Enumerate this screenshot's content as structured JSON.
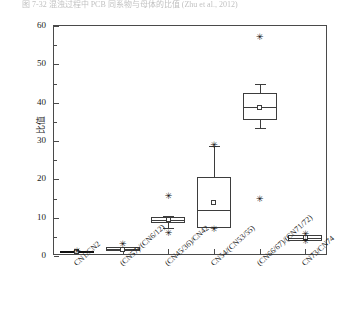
{
  "caption": "图 7-32   混浊过程中 PCB 同系物与母体的比值 (Zhu et al., 2012)",
  "chart_data": {
    "type": "box",
    "title": "",
    "xlabel": "",
    "ylabel": "比值",
    "ylim": [
      0,
      60
    ],
    "yticks": [
      0,
      10,
      20,
      30,
      40,
      50,
      60
    ],
    "ytick_labels": [
      "0",
      "10",
      "20",
      "30",
      "40",
      "50",
      "60"
    ],
    "minor_ticks": true,
    "grid": false,
    "legend": null,
    "categories": [
      "CN1/CN2",
      "(CN57)/(CN6/12)",
      "(CN45/36)/CN42",
      "CN54/(CN53/55)",
      "(CN66/67)/(CN71/72)",
      "CN73/CN74"
    ],
    "boxes": [
      {
        "label": "CN1/CN2",
        "q1": 1.0,
        "median": 1.1,
        "q3": 1.2,
        "whisker_low": 1.0,
        "whisker_high": 1.2,
        "mean": 1.1,
        "outliers": [
          1.1
        ]
      },
      {
        "label": "(CN57)/(CN6/12)",
        "q1": 1.2,
        "median": 1.8,
        "q3": 2.4,
        "whisker_low": 1.2,
        "whisker_high": 2.4,
        "mean": 1.8,
        "outliers": [
          3.0
        ]
      },
      {
        "label": "(CN45/36)/CN42",
        "q1": 8.6,
        "median": 9.4,
        "q3": 10.1,
        "whisker_low": 7.3,
        "whisker_high": 10.5,
        "mean": 9.5,
        "outliers": [
          15.4,
          5.8
        ]
      },
      {
        "label": "CN54/(CN53/55)",
        "q1": 7.2,
        "median": 12.0,
        "q3": 20.6,
        "whisker_low": 7.2,
        "whisker_high": 28.8,
        "mean": 14.0,
        "outliers": [
          28.8,
          6.8
        ]
      },
      {
        "label": "(CN66/67)/(CN71/72)",
        "q1": 35.6,
        "median": 39.0,
        "q3": 42.6,
        "whisker_low": 33.5,
        "whisker_high": 45.0,
        "mean": 38.8,
        "outliers": [
          57.0,
          14.7
        ]
      },
      {
        "label": "CN73/CN74",
        "q1": 4.0,
        "median": 4.6,
        "q3": 5.4,
        "whisker_low": 4.0,
        "whisker_high": 5.4,
        "mean": 4.7,
        "outliers": [
          5.6,
          3.9
        ]
      }
    ],
    "marker_outlier": "✳",
    "marker_mean": "square-open",
    "colors": {
      "line": "#3d3d3d",
      "marker": "#111111",
      "frame": "#4a4a4a"
    }
  }
}
